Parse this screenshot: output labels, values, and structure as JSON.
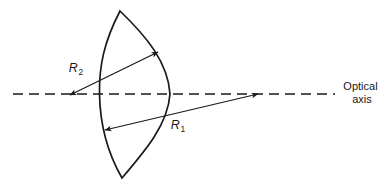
{
  "figure": {
    "kind": "optics-diagram",
    "background_color": "#ffffff",
    "stroke_color": "#1a1a1a",
    "width": 389,
    "height": 191
  },
  "labels": {
    "radius_front": {
      "symbol": "R",
      "subscript": "1"
    },
    "radius_rear": {
      "symbol": "R",
      "subscript": "2"
    },
    "optical_axis_line1": "Optical",
    "optical_axis_line2": "axis"
  },
  "geometry": {
    "optical_axis": {
      "y": 94,
      "x_start": 13,
      "x_end": 335,
      "dash": "10 6"
    },
    "lens": {
      "top_apex": [
        120,
        11
      ],
      "bottom_apex": [
        122,
        178
      ],
      "front_surface_extreme_x": 99,
      "rear_surface_extreme_x": 170,
      "front_axis_crossing_x": 100,
      "rear_axis_crossing_x": 168
    },
    "arrow_r2": {
      "from": [
        70,
        95
      ],
      "to": [
        158,
        52
      ],
      "label_at": [
        76,
        70
      ]
    },
    "arrow_r1": {
      "from": [
        258,
        94
      ],
      "to": [
        105,
        130
      ],
      "label_at": [
        176,
        127
      ]
    },
    "axis_caption_at": [
      340,
      84
    ]
  }
}
